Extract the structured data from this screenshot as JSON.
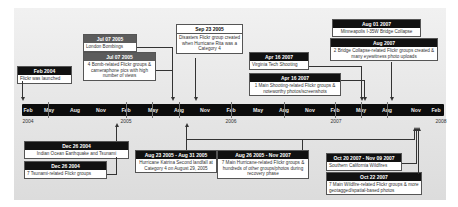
{
  "axis": {
    "months": [
      "Feb",
      "May",
      "Aug",
      "Nov",
      "Feb",
      "May",
      "Aug",
      "Nov",
      "Feb",
      "May",
      "Aug",
      "Nov",
      "Feb",
      "May",
      "Aug",
      "Nov",
      "Feb"
    ],
    "years": [
      "2004",
      "2005",
      "2006",
      "2007",
      "2008"
    ]
  },
  "events_above": [
    {
      "date": "Feb 2004",
      "text": "Flickr was launched"
    },
    {
      "date": "Jul 07 2005",
      "text": "London Bombings"
    },
    {
      "date": "Jul 07 2005",
      "text": "4 Bomb-related Flickr groups & cameraphone pics with high number of views"
    },
    {
      "date": "Sep 23 2005",
      "text": "Disasters Flickr group created when Hurricane Rita was a Category 4"
    },
    {
      "date": "Apr 16 2007",
      "text": "Virginia Tech Shooting"
    },
    {
      "date": "Apr 16 2007",
      "text": "1 Main Shooting-related Flickr groups & noteworthy photos/screenshots"
    },
    {
      "date": "Aug 01 2007",
      "text": "Minneapolis I-35W Bridge Collapse"
    },
    {
      "date": "Aug 2007",
      "text": "2 Bridge Collapse-related Flickr groups created & many eyewitness photo uploads"
    }
  ],
  "events_below": [
    {
      "date": "Dec 26 2004",
      "text": "Indian Ocean Earthquake and Tsunami"
    },
    {
      "date": "Dec 26 2004",
      "text": "7 Tsunami-related Flickr groups"
    },
    {
      "date": "Aug 23 2005 - Aug 31 2005",
      "text": "Hurricane Katrina Second landfall at Category 4 on August 29, 2005"
    },
    {
      "date": "Aug 26 2005 - Nov 2007",
      "text": "7 Main Hurricane-related Flickr groups & hundreds of other groups/photos during recovery phase"
    },
    {
      "date": "Oct 20 2007 - Nov 09 2007",
      "text": "Southern California Wildfires"
    },
    {
      "date": "Oct 22 2007",
      "text": "7 Main Wildfire-related Flickr groups & more geotagged/spatial-based photos"
    }
  ]
}
